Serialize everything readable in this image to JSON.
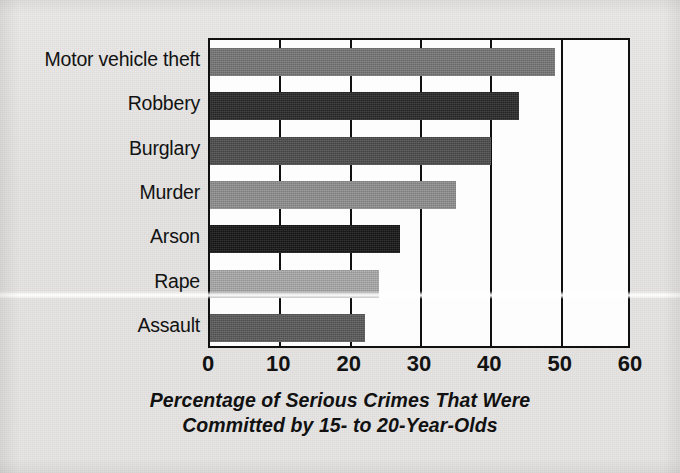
{
  "chart_data": {
    "type": "bar",
    "orientation": "horizontal",
    "title": "",
    "xlabel": "Percentage of Serious Crimes That Were Committed by 15- to 20-Year-Olds",
    "xlabel_lines": [
      "Percentage of Serious Crimes That Were",
      "Committed by 15- to 20-Year-Olds"
    ],
    "ylabel": "",
    "categories": [
      "Motor vehicle theft",
      "Robbery",
      "Burglary",
      "Murder",
      "Arson",
      "Rape",
      "Assault"
    ],
    "values": [
      49,
      44,
      40,
      35,
      27,
      24,
      22
    ],
    "bar_colors": [
      "#767676",
      "#2a2a2a",
      "#4c4c4c",
      "#8f8f8f",
      "#161616",
      "#a9a9a9",
      "#5a5a5a"
    ],
    "xlim": [
      0,
      60
    ],
    "xticks": [
      0,
      10,
      20,
      30,
      40,
      50,
      60
    ],
    "xtick_labels": [
      "0",
      "10",
      "20",
      "30",
      "40",
      "50",
      "60"
    ],
    "grid": "vertical gridlines at every 10 units",
    "legend": "none",
    "series": [
      {
        "name": "Percentage of serious crimes committed by 15- to 20-year-olds",
        "points": [
          {
            "category": "Motor vehicle theft",
            "value": 49
          },
          {
            "category": "Robbery",
            "value": 44
          },
          {
            "category": "Burglary",
            "value": 40
          },
          {
            "category": "Murder",
            "value": 35
          },
          {
            "category": "Arson",
            "value": 27
          },
          {
            "category": "Rape",
            "value": 24
          },
          {
            "category": "Assault",
            "value": 22
          }
        ]
      }
    ]
  },
  "figure": {
    "background_color": "#e6e5e3",
    "plot_background_color": "#fdfdfd",
    "axis_color": "#101010"
  }
}
